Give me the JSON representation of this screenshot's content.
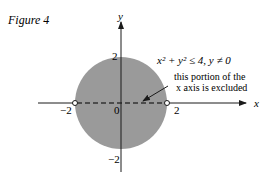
{
  "figure": {
    "caption": "Figure 4",
    "axis_labels": {
      "x": "x",
      "y": "y"
    },
    "ticks": {
      "x_neg": "−2",
      "x_pos": "2",
      "y_pos": "2",
      "y_neg": "−2",
      "origin": "0"
    },
    "region_label": "x² + y² ≤ 4, y ≠ 0",
    "annotation_line1": "this portion of the",
    "annotation_line2": "x axis is excluded",
    "colors": {
      "region_fill": "#9a9a9a",
      "axis": "#1a1a1a",
      "background": "#ffffff"
    },
    "region": {
      "type": "disk",
      "radius": 2,
      "center": [
        0,
        0
      ],
      "excluded": "segment of x axis from -2 to 2"
    }
  }
}
